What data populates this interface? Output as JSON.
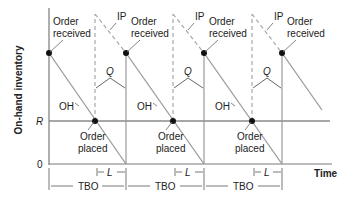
{
  "diagram": {
    "y_axis_label": "On-hand inventory",
    "x_axis_label": "Time",
    "y_ticks": {
      "R": "R",
      "zero": "0"
    },
    "labels": {
      "order_received": [
        "Order",
        "received"
      ],
      "order_placed": [
        "Order",
        "placed"
      ],
      "ip": "IP",
      "oh": "OH",
      "q": "Q",
      "l": "L",
      "tbo": "TBO"
    },
    "colors": {
      "line": "#9a9a9a",
      "axis": "#7a7a7a",
      "dot": "#111111",
      "text": "#222222"
    },
    "cycles": 3
  }
}
